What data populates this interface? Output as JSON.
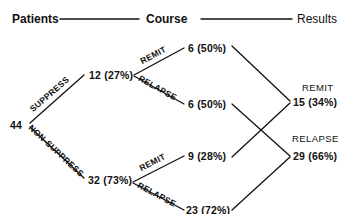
{
  "headers": {
    "patients": "Patients",
    "course": "Course",
    "results": "Results"
  },
  "root": {
    "value": "44"
  },
  "level1": {
    "suppress": {
      "branch_label": "SUPPRESS",
      "value": "12 (27%)"
    },
    "non_suppress": {
      "branch_label": "NON-SUPPRESS",
      "value": "32 (73%)"
    }
  },
  "level2": {
    "suppress_remit": {
      "branch_label": "REMIT",
      "value": "6 (50%)"
    },
    "suppress_relapse": {
      "branch_label": "RELAPSE",
      "value": "6 (50%)"
    },
    "non_suppress_remit": {
      "branch_label": "REMIT",
      "value": "9 (28%)"
    },
    "non_suppress_relapse": {
      "branch_label": "RELAPSE",
      "value": "23 (72%)"
    }
  },
  "results": {
    "remit": {
      "label": "REMIT",
      "value": "15 (34%)"
    },
    "relapse": {
      "label": "RELAPSE",
      "value": "29 (66%)"
    }
  },
  "colors": {
    "ink": "#111111",
    "background": "#ffffff"
  }
}
